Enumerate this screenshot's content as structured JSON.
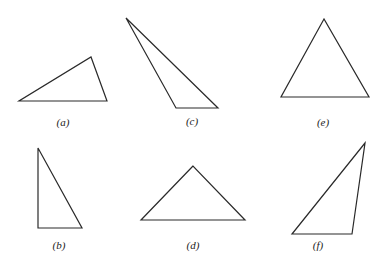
{
  "figure": {
    "width": 381,
    "height": 266,
    "stroke_color": "#2a2a2a",
    "triangles": [
      {
        "id": "a",
        "label": "(a)",
        "points": [
          [
            19,
            101
          ],
          [
            107,
            101
          ],
          [
            91,
            57
          ]
        ],
        "label_pos": [
          63,
          122
        ]
      },
      {
        "id": "b",
        "label": "(b)",
        "points": [
          [
            38,
            148
          ],
          [
            38,
            228
          ],
          [
            82,
            228
          ]
        ],
        "label_pos": [
          59,
          245
        ]
      },
      {
        "id": "c",
        "label": "(c)",
        "points": [
          [
            126,
            18
          ],
          [
            176,
            108
          ],
          [
            218,
            108
          ]
        ],
        "label_pos": [
          192,
          121
        ]
      },
      {
        "id": "d",
        "label": "(d)",
        "points": [
          [
            193,
            166
          ],
          [
            141,
            220
          ],
          [
            245,
            220
          ]
        ],
        "label_pos": [
          193,
          245
        ]
      },
      {
        "id": "e",
        "label": "(e)",
        "points": [
          [
            324,
            19
          ],
          [
            281,
            97
          ],
          [
            369,
            97
          ]
        ],
        "label_pos": [
          323,
          122
        ]
      },
      {
        "id": "f",
        "label": "(f)",
        "points": [
          [
            365,
            143
          ],
          [
            292,
            234
          ],
          [
            352,
            234
          ]
        ],
        "label_pos": [
          318,
          245
        ]
      }
    ]
  }
}
